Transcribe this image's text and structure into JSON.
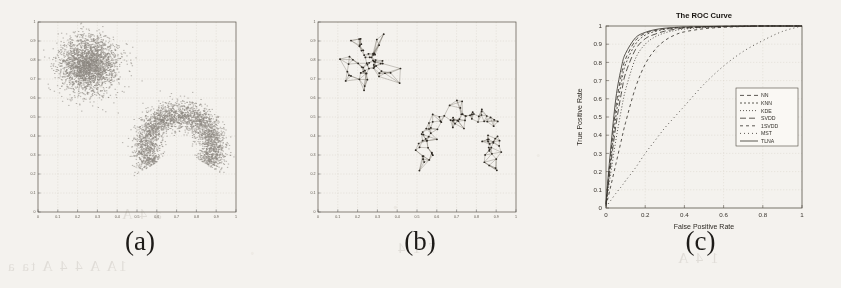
{
  "figure": {
    "background_color": "#f4f2ee",
    "ink_color": "#3a352e",
    "panels": [
      {
        "id": "a",
        "caption": "(a)"
      },
      {
        "id": "b",
        "caption": "(b)"
      },
      {
        "id": "c",
        "caption": "(c)"
      }
    ]
  },
  "bleed_through": [
    {
      "text": "1A A  4 4  A  ta  a",
      "x": 6,
      "y": 258
    },
    {
      "text": "7 1 4",
      "x": 396,
      "y": 240
    },
    {
      "text": "1 4 A",
      "x": 676,
      "y": 250
    },
    {
      "text": "a  4 A",
      "x": 120,
      "y": 206
    }
  ],
  "panel_a": {
    "caption": "(a)",
    "chart_data": {
      "type": "scatter",
      "title": "",
      "xlabel": "",
      "ylabel": "",
      "xlim": [
        0,
        1
      ],
      "ylim": [
        0,
        1
      ],
      "grid": true,
      "xticks": [
        0,
        0.1,
        0.2,
        0.3,
        0.4,
        0.5,
        0.6,
        0.7,
        0.8,
        0.9,
        1
      ],
      "yticks": [
        0,
        0.1,
        0.2,
        0.3,
        0.4,
        0.5,
        0.6,
        0.7,
        0.8,
        0.9,
        1
      ],
      "xticklabels": [
        "0",
        "0.1",
        "0.2",
        "0.3",
        "0.4",
        "0.5",
        "0.6",
        "0.7",
        "0.8",
        "0.9",
        "1"
      ],
      "yticklabels": [
        "0",
        "0.1",
        "0.2",
        "0.3",
        "0.4",
        "0.5",
        "0.6",
        "0.7",
        "0.8",
        "0.9",
        "1"
      ],
      "marker": "dot",
      "point_color": "#4a443c",
      "series": [
        {
          "name": "gaussian-cluster",
          "shape": "gaussian",
          "n_points": 2600,
          "center": [
            0.255,
            0.775
          ],
          "sigma": [
            0.072,
            0.072
          ]
        },
        {
          "name": "crescent-cluster",
          "shape": "crescent",
          "n_points": 2900,
          "center": [
            0.715,
            0.345
          ],
          "radius": 0.175,
          "thickness": 0.085,
          "arc_start_deg": -35,
          "arc_end_deg": 215
        }
      ]
    }
  },
  "panel_b": {
    "caption": "(b)",
    "chart_data": {
      "type": "scatter",
      "title": "",
      "xlabel": "",
      "ylabel": "",
      "xlim": [
        0,
        1
      ],
      "ylim": [
        0,
        1
      ],
      "grid": true,
      "xticks": [
        0,
        0.1,
        0.2,
        0.3,
        0.4,
        0.5,
        0.6,
        0.7,
        0.8,
        0.9,
        1
      ],
      "yticks": [
        0,
        0.1,
        0.2,
        0.3,
        0.4,
        0.5,
        0.6,
        0.7,
        0.8,
        0.9,
        1
      ],
      "xticklabels": [
        "0",
        "0.1",
        "0.2",
        "0.3",
        "0.4",
        "0.5",
        "0.6",
        "0.7",
        "0.8",
        "0.9",
        "1"
      ],
      "yticklabels": [
        "0",
        "0.1",
        "0.2",
        "0.3",
        "0.4",
        "0.5",
        "0.6",
        "0.7",
        "0.8",
        "0.9",
        "1"
      ],
      "marker": "node-with-edges",
      "point_color": "#2e2a24",
      "edge_color": "#6a645a",
      "series": [
        {
          "name": "gaussian-cluster-graph",
          "shape": "gaussian",
          "n_points": 62,
          "center": [
            0.255,
            0.775
          ],
          "sigma": [
            0.062,
            0.062
          ],
          "neighbors": 4
        },
        {
          "name": "crescent-cluster-graph",
          "shape": "crescent",
          "n_points": 95,
          "center": [
            0.715,
            0.345
          ],
          "radius": 0.175,
          "thickness": 0.082,
          "arc_start_deg": -35,
          "arc_end_deg": 215,
          "neighbors": 4
        }
      ]
    }
  },
  "panel_c": {
    "caption": "(c)",
    "chart_data": {
      "type": "line",
      "title": "The ROC Curve",
      "xlabel": "False Positive Rate",
      "ylabel": "True Positive Rate",
      "xlim": [
        0,
        1
      ],
      "ylim": [
        0,
        1
      ],
      "grid": true,
      "xticks": [
        0,
        0.2,
        0.4,
        0.6,
        0.8,
        1
      ],
      "xticklabels": [
        "0",
        "0.2",
        "0.4",
        "0.6",
        "0.8",
        "1"
      ],
      "yticks": [
        0,
        0.1,
        0.2,
        0.3,
        0.4,
        0.5,
        0.6,
        0.7,
        0.8,
        0.9,
        1
      ],
      "yticklabels": [
        "0",
        "0.1",
        "0.2",
        "0.3",
        "0.4",
        "0.5",
        "0.6",
        "0.7",
        "0.8",
        "0.9",
        "1"
      ],
      "legend_position": "center-right",
      "x": [
        0,
        0.02,
        0.05,
        0.08,
        0.1,
        0.15,
        0.2,
        0.25,
        0.3,
        0.35,
        0.4,
        0.5,
        0.6,
        0.7,
        0.8,
        0.9,
        1
      ],
      "series": [
        {
          "name": "NN",
          "dash": "4,3",
          "values": [
            0.02,
            0.25,
            0.55,
            0.74,
            0.82,
            0.92,
            0.96,
            0.975,
            0.985,
            0.99,
            0.993,
            0.996,
            0.998,
            0.999,
            1,
            1,
            1
          ]
        },
        {
          "name": "KNN",
          "dash": "2,2",
          "values": [
            0.02,
            0.22,
            0.5,
            0.7,
            0.79,
            0.9,
            0.95,
            0.97,
            0.982,
            0.988,
            0.991,
            0.995,
            0.997,
            0.999,
            1,
            1,
            1
          ]
        },
        {
          "name": "KDE",
          "dash": "1,2",
          "values": [
            0.015,
            0.16,
            0.37,
            0.55,
            0.65,
            0.82,
            0.9,
            0.94,
            0.962,
            0.975,
            0.983,
            0.992,
            0.996,
            0.998,
            1,
            1,
            1
          ]
        },
        {
          "name": "SVDD",
          "dash": "6,3",
          "values": [
            0.02,
            0.2,
            0.45,
            0.64,
            0.74,
            0.87,
            0.93,
            0.955,
            0.972,
            0.982,
            0.988,
            0.994,
            0.997,
            0.999,
            1,
            1,
            1
          ]
        },
        {
          "name": "1SVDD",
          "dash": "3,3",
          "values": [
            0.01,
            0.1,
            0.24,
            0.38,
            0.47,
            0.66,
            0.79,
            0.87,
            0.92,
            0.95,
            0.968,
            0.985,
            0.993,
            0.997,
            1,
            1,
            1
          ]
        },
        {
          "name": "MST",
          "dash": "1,3",
          "values": [
            0.005,
            0.035,
            0.08,
            0.12,
            0.15,
            0.22,
            0.3,
            0.37,
            0.44,
            0.5,
            0.56,
            0.68,
            0.78,
            0.86,
            0.92,
            0.97,
            1
          ]
        },
        {
          "name": "TLNA",
          "dash": "0",
          "values": [
            0.03,
            0.28,
            0.6,
            0.78,
            0.85,
            0.935,
            0.965,
            0.98,
            0.988,
            0.992,
            0.995,
            0.997,
            0.999,
            1,
            1,
            1,
            1
          ]
        }
      ]
    }
  }
}
